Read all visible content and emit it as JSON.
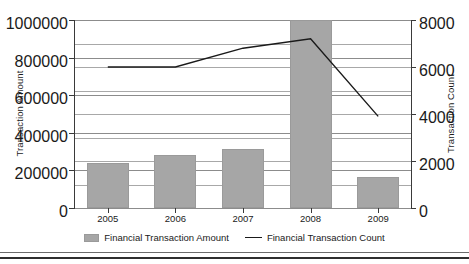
{
  "chart_data": {
    "type": "bar",
    "title": "",
    "categories": [
      "2005",
      "2006",
      "2007",
      "2008",
      "2009"
    ],
    "xlabel": "",
    "ylabel": "Transaction Amount",
    "y2label": "Transaction Count",
    "ylim": [
      0,
      1000000
    ],
    "y2lim": [
      0,
      8000
    ],
    "yticks": [
      "0",
      "200000",
      "400000",
      "600000",
      "800000",
      "1000000"
    ],
    "ytick_values": [
      0,
      200000,
      400000,
      600000,
      800000,
      1000000
    ],
    "y2ticks": [
      "0",
      "2000",
      "4000",
      "6000",
      "8000"
    ],
    "y2tick_values": [
      0,
      2000,
      4000,
      6000,
      8000
    ],
    "grid": true,
    "legend_position": "bottom",
    "series": [
      {
        "name": "Financial Transaction Amount",
        "type": "bar",
        "axis": "left",
        "color": "#a6a6a6",
        "values": [
          239000,
          282000,
          314000,
          1000000,
          165000
        ]
      },
      {
        "name": "Financial Transaction Count",
        "type": "line",
        "axis": "right",
        "color": "#1a1a1a",
        "values": [
          6000,
          6000,
          6800,
          7200,
          3900
        ]
      }
    ]
  },
  "legend": {
    "items": [
      {
        "label": "Financial Transaction Amount",
        "marker": "bar-swatch"
      },
      {
        "label": "Financial Transaction Count",
        "marker": "line-swatch"
      }
    ]
  }
}
